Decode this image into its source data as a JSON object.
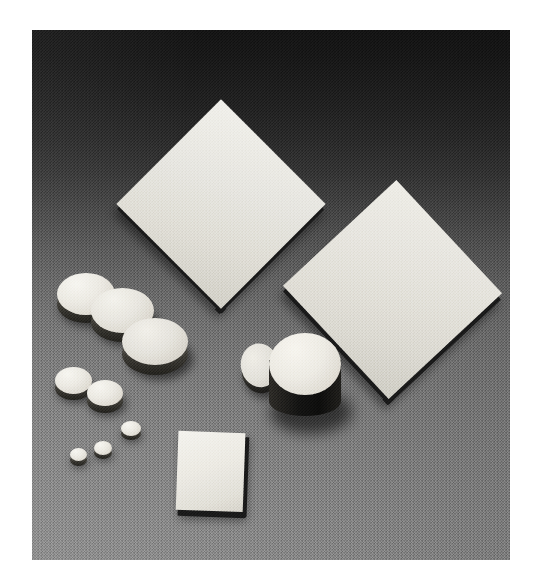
{
  "page": {
    "kind": "photograph",
    "canvas": {
      "width": 533,
      "height": 584,
      "background_color": "#ffffff"
    }
  },
  "photo": {
    "frame": {
      "left": 32,
      "top": 30,
      "width": 478,
      "height": 530
    },
    "color_mode": "grayscale",
    "backdrop": {
      "description": "seamless studio sweep, graduated from near-black at top to medium gray at bottom",
      "top_color": "#121212",
      "mid_color": "#5a5a5a",
      "bottom_color": "#8a8a8a",
      "texture": "fine film grain"
    },
    "lighting": {
      "key_light_direction": "upper-left",
      "shadow_direction": "lower-right",
      "specimen_top_color": "#ecebE4",
      "specimen_edge_color": "#171717"
    },
    "specimens": [
      {
        "id": "plate-large-upper-left",
        "shape": "square plate",
        "orientation_deg": 45,
        "size_px": 148,
        "center": {
          "x": 221,
          "y": 204
        },
        "top_face_color": "#eceae3",
        "edge_color": "#1a1a1a"
      },
      {
        "id": "plate-large-right",
        "shape": "square plate",
        "orientation_deg": 47,
        "size_px": 155,
        "center": {
          "x": 392,
          "y": 290
        },
        "top_face_color": "#e9e7e0",
        "edge_color": "#1a1a1a"
      },
      {
        "id": "plate-small-lower-center",
        "shape": "square plate",
        "orientation_deg": 3,
        "size_px": 68,
        "center": {
          "x": 213,
          "y": 470
        },
        "top_face_color": "#efeee8",
        "edge_color": "#161616"
      },
      {
        "id": "disc-large-back",
        "shape": "disc",
        "diameter_px": 56,
        "center": {
          "x": 85,
          "y": 303
        },
        "top_face_color": "#efede6"
      },
      {
        "id": "disc-large-middle",
        "shape": "disc",
        "diameter_px": 60,
        "center": {
          "x": 122,
          "y": 320
        },
        "top_face_color": "#eceae3"
      },
      {
        "id": "disc-large-front",
        "shape": "disc",
        "diameter_px": 62,
        "center": {
          "x": 152,
          "y": 347
        },
        "top_face_color": "#e8e6df"
      },
      {
        "id": "disc-medium-left",
        "shape": "disc",
        "diameter_px": 34,
        "center": {
          "x": 71,
          "y": 385
        },
        "top_face_color": "#eeece5"
      },
      {
        "id": "disc-medium-right",
        "shape": "disc",
        "diameter_px": 33,
        "center": {
          "x": 104,
          "y": 397
        },
        "top_face_color": "#eceae3"
      },
      {
        "id": "disc-small-upper",
        "shape": "disc",
        "diameter_px": 19,
        "center": {
          "x": 131,
          "y": 432
        },
        "top_face_color": "#eeece5"
      },
      {
        "id": "disc-small-middle",
        "shape": "disc",
        "diameter_px": 17,
        "center": {
          "x": 103,
          "y": 452
        },
        "top_face_color": "#ebe9e2"
      },
      {
        "id": "disc-small-left",
        "shape": "disc",
        "diameter_px": 16,
        "center": {
          "x": 78,
          "y": 458
        },
        "top_face_color": "#e9e7e0"
      },
      {
        "id": "disc-thin-leaning",
        "shape": "thin disc leaning on cylinder",
        "diameter_px": 40,
        "center": {
          "x": 270,
          "y": 364
        },
        "top_face_color": "#e7e5de"
      },
      {
        "id": "cylinder-tall",
        "shape": "tall cylinder",
        "diameter_px": 70,
        "height_px": 46,
        "center": {
          "x": 304,
          "y": 372
        },
        "top_face_color": "#f0eee7",
        "body_color": "#121211"
      }
    ],
    "specimen_counts": {
      "large_square_plates": 2,
      "small_square_plates": 1,
      "large_discs": 3,
      "medium_discs": 2,
      "small_discs": 3,
      "cylinders": 1,
      "thin_discs": 1,
      "total": 13
    }
  }
}
